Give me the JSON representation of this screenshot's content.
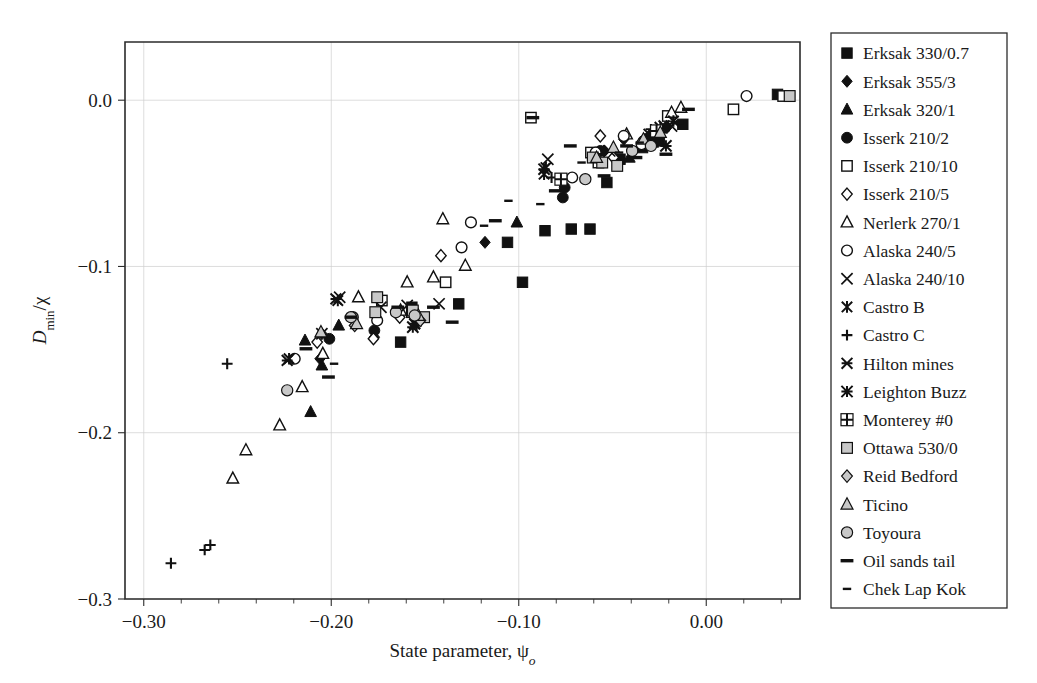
{
  "figure": {
    "type": "scatter",
    "width": 1037,
    "height": 683
  },
  "chart_data": {
    "type": "scatter",
    "title": "",
    "xlabel": "State parameter, ψ",
    "xlabel_sub": "o",
    "ylabel": "D",
    "ylabel_sub": "min",
    "ylabel_tail": "/χ",
    "xlim": [
      -0.31,
      0.05
    ],
    "ylim": [
      -0.3,
      0.035
    ],
    "xticks": [
      -0.3,
      -0.2,
      -0.1,
      0.0
    ],
    "xticklabels": [
      "−0.30",
      "−0.20",
      "−0.10",
      "0.00"
    ],
    "xtick_minor_step": 0.02,
    "yticks": [
      0.0,
      -0.1,
      -0.2,
      -0.3
    ],
    "yticklabels": [
      "0.0",
      "−0.1",
      "−0.2",
      "−0.3"
    ],
    "grid": true,
    "grid_color": "#cfcfcf",
    "legend_position": "right-outside",
    "series": [
      {
        "name": "Erksak 330/0.7",
        "marker": "filled-square",
        "color": "#111111",
        "points": [
          [
            -0.163,
            -0.1455
          ],
          [
            -0.157,
            -0.1245
          ],
          [
            -0.132,
            -0.1225
          ],
          [
            -0.106,
            -0.0855
          ],
          [
            -0.098,
            -0.1095
          ],
          [
            -0.086,
            -0.0785
          ],
          [
            -0.072,
            -0.0775
          ],
          [
            -0.062,
            -0.0775
          ],
          [
            -0.053,
            -0.0495
          ],
          [
            -0.046,
            -0.0355
          ],
          [
            -0.034,
            -0.0285
          ],
          [
            -0.025,
            -0.0245
          ],
          [
            -0.0125,
            -0.0145
          ],
          [
            0.038,
            0.0035
          ]
        ]
      },
      {
        "name": "Erksak 355/3",
        "marker": "filled-diamond",
        "color": "#111111",
        "points": [
          [
            -0.206,
            -0.1555
          ],
          [
            -0.205,
            -0.1405
          ],
          [
            -0.177,
            -0.1425
          ],
          [
            -0.118,
            -0.0855
          ],
          [
            -0.0545,
            -0.0305
          ],
          [
            -0.044,
            -0.0235
          ],
          [
            -0.0305,
            -0.0215
          ],
          [
            -0.021,
            -0.0165
          ]
        ]
      },
      {
        "name": "Erksak 320/1",
        "marker": "filled-triangle",
        "color": "#111111",
        "points": [
          [
            -0.211,
            -0.1875
          ],
          [
            -0.205,
            -0.1595
          ],
          [
            -0.214,
            -0.1445
          ],
          [
            -0.196,
            -0.1355
          ],
          [
            -0.101,
            -0.0735
          ],
          [
            -0.041,
            -0.0345
          ],
          [
            -0.0285,
            -0.0255
          ]
        ]
      },
      {
        "name": "Isserk 210/2",
        "marker": "filled-circle",
        "color": "#111111",
        "points": [
          [
            -0.201,
            -0.1435
          ],
          [
            -0.177,
            -0.1385
          ],
          [
            -0.0765,
            -0.0585
          ],
          [
            -0.0755,
            -0.0525
          ],
          [
            -0.0565,
            -0.0305
          ],
          [
            -0.0335,
            -0.0245
          ]
        ]
      },
      {
        "name": "Isserk 210/10",
        "marker": "open-square",
        "color": "#111111",
        "points": [
          [
            -0.173,
            -0.1205
          ],
          [
            -0.157,
            -0.1275
          ],
          [
            -0.139,
            -0.1095
          ],
          [
            -0.0935,
            -0.0105
          ],
          [
            -0.0615,
            -0.0315
          ],
          [
            -0.0575,
            -0.0375
          ],
          [
            -0.0205,
            -0.0095
          ],
          [
            0.0145,
            -0.0055
          ],
          [
            0.041,
            0.0025
          ]
        ]
      },
      {
        "name": "Isserk 210/5",
        "marker": "open-diamond",
        "color": "#111111",
        "points": [
          [
            -0.2075,
            -0.1455
          ],
          [
            -0.1775,
            -0.1435
          ],
          [
            -0.1415,
            -0.0935
          ],
          [
            -0.0565,
            -0.0215
          ],
          [
            -0.0495,
            -0.0345
          ],
          [
            -0.1635,
            -0.1305
          ]
        ]
      },
      {
        "name": "Nerlerk 270/1",
        "marker": "open-triangle",
        "color": "#111111",
        "points": [
          [
            -0.2455,
            -0.2105
          ],
          [
            -0.2525,
            -0.2275
          ],
          [
            -0.2275,
            -0.1955
          ],
          [
            -0.2155,
            -0.1725
          ],
          [
            -0.2045,
            -0.1525
          ],
          [
            -0.1855,
            -0.1185
          ],
          [
            -0.163,
            -0.1265
          ],
          [
            -0.1595,
            -0.1095
          ],
          [
            -0.1455,
            -0.1065
          ],
          [
            -0.1405,
            -0.0715
          ],
          [
            -0.1285,
            -0.0995
          ],
          [
            -0.0425,
            -0.0205
          ],
          [
            -0.0185,
            -0.0075
          ],
          [
            -0.0135,
            -0.0045
          ]
        ]
      },
      {
        "name": "Alaska 240/5",
        "marker": "open-circle",
        "color": "#111111",
        "points": [
          [
            -0.2195,
            -0.1555
          ],
          [
            -0.1885,
            -0.1305
          ],
          [
            -0.1755,
            -0.1325
          ],
          [
            -0.1305,
            -0.0885
          ],
          [
            -0.1255,
            -0.0735
          ],
          [
            -0.0715,
            -0.0465
          ],
          [
            -0.059,
            -0.0315
          ],
          [
            -0.044,
            -0.0215
          ],
          [
            0.0215,
            0.0025
          ],
          [
            -0.0345,
            -0.0265
          ]
        ]
      },
      {
        "name": "Alaska 240/10",
        "marker": "cross-x",
        "color": "#111111",
        "points": [
          [
            -0.205,
            -0.1405
          ],
          [
            -0.1955,
            -0.1185
          ],
          [
            -0.1735,
            -0.1245
          ],
          [
            -0.1595,
            -0.1235
          ],
          [
            -0.1425,
            -0.1225
          ],
          [
            -0.0845,
            -0.0355
          ],
          [
            -0.0515,
            -0.0305
          ],
          [
            -0.0185,
            -0.0155
          ]
        ]
      },
      {
        "name": "Castro B",
        "marker": "star-x",
        "color": "#111111",
        "points": [
          [
            -0.2225,
            -0.1555
          ],
          [
            -0.1965,
            -0.1205
          ],
          [
            -0.1575,
            -0.1265
          ],
          [
            -0.1555,
            -0.1345
          ],
          [
            -0.0865,
            -0.0445
          ],
          [
            -0.0855,
            -0.0405
          ],
          [
            -0.0175,
            -0.0125
          ]
        ]
      },
      {
        "name": "Castro C",
        "marker": "plus",
        "color": "#111111",
        "points": [
          [
            -0.2855,
            -0.2785
          ],
          [
            -0.2675,
            -0.2705
          ],
          [
            -0.2645,
            -0.2675
          ],
          [
            -0.2555,
            -0.1585
          ],
          [
            -0.1545,
            -0.1355
          ],
          [
            -0.0825,
            -0.0465
          ],
          [
            -0.0295,
            -0.0175
          ]
        ]
      },
      {
        "name": "Hilton mines",
        "marker": "star-6",
        "color": "#111111",
        "points": [
          [
            -0.2235,
            -0.1565
          ],
          [
            -0.1975,
            -0.1195
          ],
          [
            -0.1555,
            -0.1345
          ],
          [
            -0.0225,
            -0.0155
          ],
          [
            -0.0305,
            -0.0205
          ]
        ]
      },
      {
        "name": "Leighton Buzz",
        "marker": "star-8",
        "color": "#111111",
        "points": [
          [
            -0.0865,
            -0.0415
          ],
          [
            -0.0215,
            -0.0275
          ],
          [
            -0.0245,
            -0.0165
          ],
          [
            -0.1565,
            -0.1365
          ]
        ]
      },
      {
        "name": "Monterey #0",
        "marker": "plus-box",
        "color": "#111111",
        "points": [
          [
            -0.0775,
            -0.0475
          ],
          [
            -0.0265,
            -0.0185
          ]
        ]
      },
      {
        "name": "Ottawa 530/0",
        "marker": "grey-square",
        "color": "#c8c8c8",
        "points": [
          [
            -0.1755,
            -0.1185
          ],
          [
            -0.1765,
            -0.1275
          ],
          [
            -0.1565,
            -0.1265
          ],
          [
            -0.1505,
            -0.1305
          ],
          [
            -0.0605,
            -0.0345
          ],
          [
            -0.0555,
            -0.0375
          ],
          [
            -0.0475,
            -0.0395
          ],
          [
            0.0445,
            0.0025
          ]
        ]
      },
      {
        "name": "Reid Bedford",
        "marker": "grey-diamond",
        "color": "#c8c8c8",
        "points": [
          [
            -0.1875,
            -0.1355
          ],
          [
            -0.1525,
            -0.1325
          ]
        ]
      },
      {
        "name": "Ticino",
        "marker": "grey-triangle",
        "color": "#c8c8c8",
        "points": [
          [
            -0.2055,
            -0.1395
          ],
          [
            -0.1865,
            -0.1345
          ],
          [
            -0.1535,
            -0.1295
          ],
          [
            -0.0585,
            -0.0345
          ],
          [
            -0.0495,
            -0.0285
          ],
          [
            -0.0335,
            -0.0235
          ],
          [
            -0.0245,
            -0.0195
          ]
        ]
      },
      {
        "name": "Toyoura",
        "marker": "grey-circle",
        "color": "#c8c8c8",
        "points": [
          [
            -0.2235,
            -0.1745
          ],
          [
            -0.1895,
            -0.1305
          ],
          [
            -0.1655,
            -0.1275
          ],
          [
            -0.1555,
            -0.1295
          ],
          [
            -0.0645,
            -0.0475
          ],
          [
            -0.0395,
            -0.0305
          ],
          [
            -0.0295,
            -0.0275
          ]
        ]
      },
      {
        "name": "Oil sands tail",
        "marker": "dash-thick",
        "color": "#111111",
        "points": [
          [
            -0.2135,
            -0.1495
          ],
          [
            -0.2015,
            -0.1665
          ],
          [
            -0.1895,
            -0.1305
          ],
          [
            -0.1645,
            -0.1245
          ],
          [
            -0.1455,
            -0.1245
          ],
          [
            -0.1355,
            -0.1335
          ],
          [
            -0.1125,
            -0.0725
          ],
          [
            -0.0925,
            -0.0105
          ],
          [
            -0.0805,
            -0.0545
          ],
          [
            -0.0545,
            -0.0455
          ],
          [
            -0.0425,
            -0.0275
          ],
          [
            -0.0375,
            -0.0345
          ],
          [
            -0.0215,
            -0.0325
          ],
          [
            -0.0155,
            -0.0135
          ],
          [
            -0.0095,
            -0.0055
          ],
          [
            -0.0725,
            -0.0275
          ]
        ]
      },
      {
        "name": "Chek Lap Kok",
        "marker": "dash-thin",
        "color": "#111111",
        "points": [
          [
            -0.1985,
            -0.1585
          ],
          [
            -0.1185,
            -0.0755
          ],
          [
            -0.1055,
            -0.0605
          ],
          [
            -0.0885,
            -0.0625
          ],
          [
            -0.0665,
            -0.0375
          ],
          [
            -0.0555,
            -0.0325
          ],
          [
            -0.0465,
            -0.0315
          ],
          [
            -0.0355,
            -0.0255
          ]
        ]
      }
    ]
  },
  "legend": {
    "items": [
      {
        "label": "Erksak 330/0.7",
        "marker": "filled-square"
      },
      {
        "label": "Erksak 355/3",
        "marker": "filled-diamond"
      },
      {
        "label": "Erksak 320/1",
        "marker": "filled-triangle"
      },
      {
        "label": "Isserk 210/2",
        "marker": "filled-circle"
      },
      {
        "label": "Isserk 210/10",
        "marker": "open-square"
      },
      {
        "label": "Isserk 210/5",
        "marker": "open-diamond"
      },
      {
        "label": "Nerlerk 270/1",
        "marker": "open-triangle"
      },
      {
        "label": "Alaska 240/5",
        "marker": "open-circle"
      },
      {
        "label": "Alaska 240/10",
        "marker": "cross-x"
      },
      {
        "label": "Castro B",
        "marker": "star-x"
      },
      {
        "label": "Castro C",
        "marker": "plus"
      },
      {
        "label": "Hilton mines",
        "marker": "star-6"
      },
      {
        "label": "Leighton Buzz",
        "marker": "star-8"
      },
      {
        "label": "Monterey #0",
        "marker": "plus-box"
      },
      {
        "label": "Ottawa 530/0",
        "marker": "grey-square"
      },
      {
        "label": "Reid Bedford",
        "marker": "grey-diamond"
      },
      {
        "label": "Ticino",
        "marker": "grey-triangle"
      },
      {
        "label": "Toyoura",
        "marker": "grey-circle"
      },
      {
        "label": "Oil sands tail",
        "marker": "dash-thick"
      },
      {
        "label": "Chek Lap Kok",
        "marker": "dash-thin"
      }
    ]
  }
}
